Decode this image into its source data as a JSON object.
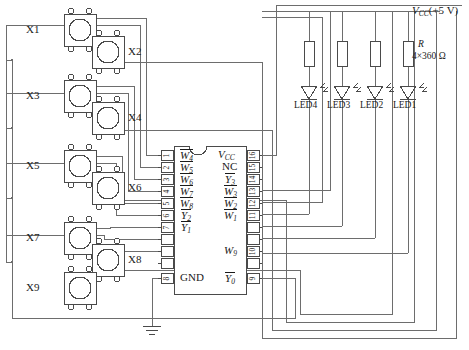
{
  "diagram": {
    "power_rail": {
      "label": "VCC (+5 V)",
      "symbol": "V",
      "sub": "CC",
      "suffix": "(+5 V)"
    },
    "resistor_block": {
      "designator": "R",
      "value": "4×360 Ω"
    }
  },
  "switches": [
    {
      "name": "X1",
      "label": "X1",
      "label_side": "left",
      "x": 64,
      "y": 14
    },
    {
      "name": "X2",
      "label": "X2",
      "label_side": "right",
      "x": 92,
      "y": 36
    },
    {
      "name": "X3",
      "label": "X3",
      "label_side": "left",
      "x": 64,
      "y": 80
    },
    {
      "name": "X4",
      "label": "X4",
      "label_side": "right",
      "x": 92,
      "y": 102
    },
    {
      "name": "X5",
      "label": "X5",
      "label_side": "left",
      "x": 64,
      "y": 150
    },
    {
      "name": "X6",
      "label": "X6",
      "label_side": "right",
      "x": 92,
      "y": 172
    },
    {
      "name": "X7",
      "label": "X7",
      "label_side": "left",
      "x": 64,
      "y": 222
    },
    {
      "name": "X8",
      "label": "X8",
      "label_side": "right",
      "x": 92,
      "y": 244
    },
    {
      "name": "X9",
      "label": "X9",
      "label_side": "left",
      "x": 64,
      "y": 272
    }
  ],
  "ic": {
    "name": "keyboard-encoder-ic",
    "left_pins": [
      {
        "num": "1",
        "label": "W4",
        "base": "W",
        "sub": "4",
        "overline": true
      },
      {
        "num": "2",
        "label": "W5",
        "base": "W",
        "sub": "5",
        "overline": true
      },
      {
        "num": "3",
        "label": "W6",
        "base": "W",
        "sub": "6",
        "overline": true
      },
      {
        "num": "4",
        "label": "W7",
        "base": "W",
        "sub": "7",
        "overline": true
      },
      {
        "num": "5",
        "label": "W8",
        "base": "W",
        "sub": "8",
        "overline": true
      },
      {
        "num": "6",
        "label": "Y2",
        "base": "Y",
        "sub": "2",
        "overline": true
      },
      {
        "num": "7",
        "label": "Y1",
        "base": "Y",
        "sub": "1",
        "overline": true
      },
      {
        "num": "8",
        "label": "GND",
        "base": "GND",
        "sub": "",
        "overline": false
      }
    ],
    "right_pins": [
      {
        "num": "16",
        "label": "VCC",
        "base": "V",
        "sub": "CC",
        "overline": false
      },
      {
        "num": "15",
        "label": "NC",
        "base": "NC",
        "sub": "",
        "overline": false
      },
      {
        "num": "14",
        "label": "Y3",
        "base": "Y",
        "sub": "3",
        "overline": true
      },
      {
        "num": "13",
        "label": "W3",
        "base": "W",
        "sub": "3",
        "overline": true
      },
      {
        "num": "12",
        "label": "W2",
        "base": "W",
        "sub": "2",
        "overline": true
      },
      {
        "num": "11",
        "label": "W1",
        "base": "W",
        "sub": "1",
        "overline": true
      },
      {
        "num": "10",
        "label": "W9",
        "base": "W",
        "sub": "9",
        "overline": false
      },
      {
        "num": "9",
        "label": "Y0",
        "base": "Y",
        "sub": "0",
        "overline": true
      }
    ]
  },
  "leds": [
    {
      "name": "LED4",
      "label": "LED4",
      "x": 309
    },
    {
      "name": "LED3",
      "label": "LED3",
      "x": 342
    },
    {
      "name": "LED2",
      "label": "LED2",
      "x": 375
    },
    {
      "name": "LED1",
      "label": "LED1",
      "x": 408
    }
  ],
  "ground": {
    "name": "ground-symbol",
    "x": 152,
    "y": 330
  },
  "colors": {
    "wire": "#6d6d6d",
    "outline": "#4a4a4a",
    "text": "#1a1a1a",
    "bg": "#ffffff"
  }
}
